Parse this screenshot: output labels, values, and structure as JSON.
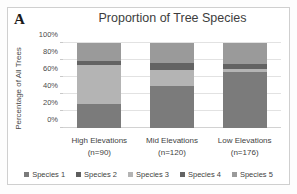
{
  "figure": {
    "panel_letter": "A",
    "background": "#ffffff",
    "border_color": "#cfcfcf"
  },
  "chart_data": {
    "type": "bar",
    "subtype": "stacked-100-percent",
    "title": "Proportion of Tree Species",
    "xlabel": "",
    "ylabel": "Percentage of All Trees",
    "ylim": [
      0,
      100
    ],
    "ytick_labels": [
      "0%",
      "20%",
      "40%",
      "60%",
      "80%",
      "100%"
    ],
    "ytick_values": [
      0,
      20,
      40,
      60,
      80,
      100
    ],
    "grid": true,
    "legend_position": "bottom",
    "categories": [
      "High Elevations",
      "Mid Elevations",
      "Low Elevations"
    ],
    "category_sublabels": [
      "(n=90)",
      "(n=120)",
      "(n=176)"
    ],
    "sample_sizes": [
      90,
      120,
      176
    ],
    "series": [
      {
        "name": "Species 1",
        "color": "#7b7b7b",
        "values": [
          28,
          50,
          66
        ]
      },
      {
        "name": "Species 2",
        "color": "#5e5e5e",
        "values": [
          0,
          0,
          0
        ]
      },
      {
        "name": "Species 3",
        "color": "#b4b4b4",
        "values": [
          46,
          18,
          4
        ]
      },
      {
        "name": "Species 4",
        "color": "#636363",
        "values": [
          5,
          8,
          5
        ]
      },
      {
        "name": "Species 5",
        "color": "#9a9a9a",
        "values": [
          21,
          24,
          25
        ]
      }
    ]
  }
}
